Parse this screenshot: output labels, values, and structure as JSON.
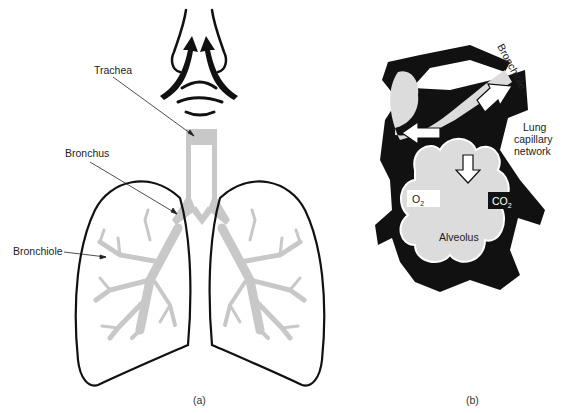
{
  "panel_a": {
    "caption": "(a)",
    "labels": {
      "trachea": "Trachea",
      "bronchus": "Bronchus",
      "bronchiole": "Bronchiole"
    }
  },
  "panel_b": {
    "caption": "(b)",
    "labels": {
      "bronchiole": "Bronchiole",
      "lung_capillary_line1": "Lung",
      "lung_capillary_line2": "capillary",
      "lung_capillary_line3": "network",
      "o2": "O",
      "o2_sub": "2",
      "co2": "CO",
      "co2_sub": "2",
      "alveolus": "Alveolus"
    }
  },
  "colors": {
    "outline": "#111111",
    "airway_gray": "#c8c8c8",
    "alveolus_fill": "#dcdcdc",
    "background": "#ffffff"
  }
}
